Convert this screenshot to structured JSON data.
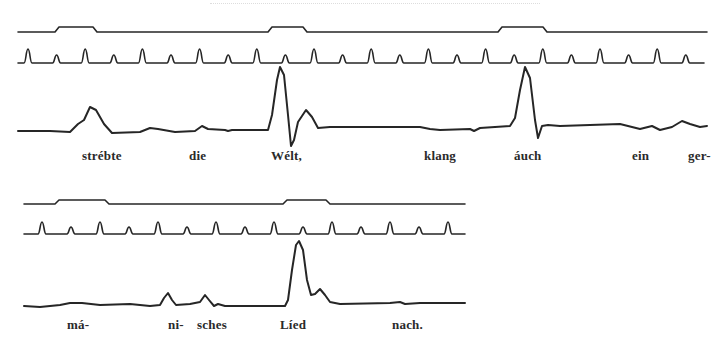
{
  "document": {
    "type": "kymograph speech recording figure",
    "trace_color": "#262626",
    "text_color": "#2a2a2a",
    "background": "#ffffff"
  },
  "block1": {
    "syllable_marker_trace": {
      "baseline_y": 32,
      "raised_y": 27,
      "x_start": 18,
      "x_end": 707,
      "raised_segments": [
        [
          57,
          95
        ],
        [
          270,
          305
        ],
        [
          500,
          545
        ]
      ]
    },
    "time_tick_trace": {
      "baseline_y": 63,
      "x_start": 18,
      "x_end": 704,
      "first_tick_x": 28,
      "spacing": 28.6,
      "tall_peak_y": 49,
      "short_peak_y": 55
    },
    "pitch_trace": {
      "points": [
        [
          18,
          131
        ],
        [
          50,
          131
        ],
        [
          70,
          132
        ],
        [
          78,
          124
        ],
        [
          84,
          120
        ],
        [
          90,
          107
        ],
        [
          96,
          110
        ],
        [
          104,
          124
        ],
        [
          112,
          133
        ],
        [
          140,
          132
        ],
        [
          150,
          128
        ],
        [
          158,
          129
        ],
        [
          175,
          132
        ],
        [
          195,
          131
        ],
        [
          202,
          126
        ],
        [
          208,
          129
        ],
        [
          225,
          130
        ],
        [
          228,
          131
        ],
        [
          232,
          130
        ],
        [
          268,
          130
        ],
        [
          272,
          115
        ],
        [
          277,
          80
        ],
        [
          280,
          67
        ],
        [
          284,
          75
        ],
        [
          288,
          115
        ],
        [
          291,
          146
        ],
        [
          294,
          140
        ],
        [
          298,
          122
        ],
        [
          306,
          110
        ],
        [
          312,
          117
        ],
        [
          318,
          128
        ],
        [
          330,
          127
        ],
        [
          360,
          127
        ],
        [
          420,
          127
        ],
        [
          430,
          129
        ],
        [
          440,
          130
        ],
        [
          470,
          129
        ],
        [
          474,
          131
        ],
        [
          480,
          128
        ],
        [
          510,
          126
        ],
        [
          515,
          118
        ],
        [
          520,
          90
        ],
        [
          525,
          67
        ],
        [
          530,
          78
        ],
        [
          535,
          120
        ],
        [
          538,
          138
        ],
        [
          542,
          126
        ],
        [
          548,
          125
        ],
        [
          560,
          126
        ],
        [
          620,
          124
        ],
        [
          640,
          129
        ],
        [
          652,
          126
        ],
        [
          660,
          130
        ],
        [
          672,
          127
        ],
        [
          682,
          121
        ],
        [
          690,
          124
        ],
        [
          700,
          127
        ],
        [
          707,
          126
        ]
      ]
    },
    "labels": [
      {
        "text": "strébte",
        "x": 82,
        "y": 149
      },
      {
        "text": "die",
        "x": 189,
        "y": 149
      },
      {
        "text": "Wélt,",
        "x": 271,
        "y": 149
      },
      {
        "text": "klang",
        "x": 424,
        "y": 149
      },
      {
        "text": "áuch",
        "x": 514,
        "y": 149
      },
      {
        "text": "ein",
        "x": 632,
        "y": 149
      },
      {
        "text": "ger-",
        "x": 688,
        "y": 149
      }
    ]
  },
  "block2": {
    "syllable_marker_trace": {
      "baseline_y": 204,
      "raised_y": 200,
      "x_start": 24,
      "x_end": 465,
      "raised_segments": [
        [
          57,
          107
        ],
        [
          285,
          328
        ]
      ]
    },
    "time_tick_trace": {
      "baseline_y": 234,
      "x_start": 24,
      "x_end": 465,
      "first_tick_x": 42,
      "spacing": 29,
      "tall_peak_y": 222,
      "short_peak_y": 227
    },
    "pitch_trace": {
      "points": [
        [
          24,
          306
        ],
        [
          40,
          307
        ],
        [
          60,
          305
        ],
        [
          70,
          303
        ],
        [
          82,
          303
        ],
        [
          100,
          305
        ],
        [
          130,
          304
        ],
        [
          150,
          306
        ],
        [
          160,
          305
        ],
        [
          164,
          298
        ],
        [
          168,
          293
        ],
        [
          172,
          300
        ],
        [
          176,
          305
        ],
        [
          190,
          304
        ],
        [
          200,
          302
        ],
        [
          205,
          295
        ],
        [
          209,
          300
        ],
        [
          214,
          306
        ],
        [
          218,
          304
        ],
        [
          225,
          306
        ],
        [
          285,
          306
        ],
        [
          288,
          300
        ],
        [
          292,
          270
        ],
        [
          296,
          245
        ],
        [
          299,
          241
        ],
        [
          303,
          250
        ],
        [
          307,
          280
        ],
        [
          311,
          295
        ],
        [
          315,
          294
        ],
        [
          320,
          289
        ],
        [
          325,
          295
        ],
        [
          330,
          302
        ],
        [
          340,
          304
        ],
        [
          390,
          303
        ],
        [
          400,
          302
        ],
        [
          405,
          304
        ],
        [
          420,
          303
        ],
        [
          465,
          303
        ]
      ]
    },
    "labels": [
      {
        "text": "má-",
        "x": 67,
        "y": 318
      },
      {
        "text": "ni-",
        "x": 168,
        "y": 318
      },
      {
        "text": "sches",
        "x": 197,
        "y": 318
      },
      {
        "text": "Líed",
        "x": 280,
        "y": 318
      },
      {
        "text": "nach.",
        "x": 392,
        "y": 318
      }
    ]
  }
}
